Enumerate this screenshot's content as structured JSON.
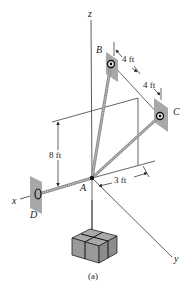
{
  "figure": {
    "caption": "(a)",
    "axes": {
      "x_label": "x",
      "y_label": "y",
      "z_label": "z"
    },
    "points": {
      "A": "A",
      "B": "B",
      "C": "C",
      "D": "D"
    },
    "dimensions": {
      "B_offset": "4 ft",
      "C_offset": "4 ft",
      "height": "8 ft",
      "y_offset": "3 ft"
    },
    "colors": {
      "plate": "#a8a8a8",
      "cable": "#8a8a8a",
      "box": "#9a9a9a",
      "line": "#222222"
    }
  }
}
